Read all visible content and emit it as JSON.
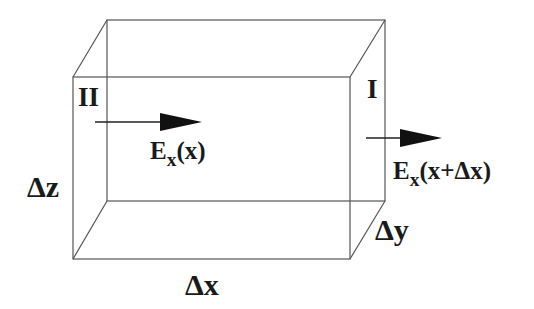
{
  "diagram": {
    "colors": {
      "line": "#555555",
      "arrow": "#111111",
      "text": "#1a1a1a",
      "background": "#ffffff"
    },
    "box": {
      "front_face": {
        "left": 73,
        "right": 350,
        "top": 77,
        "bottom": 259
      },
      "back_face": {
        "left": 107,
        "right": 385,
        "top": 20,
        "bottom": 201
      }
    },
    "faces": [
      {
        "id": "face-II",
        "label": "II"
      },
      {
        "id": "face-I",
        "label": "I"
      }
    ],
    "arrows": [
      {
        "id": "field-in",
        "symbol": "E",
        "subscript": "x",
        "argument": "(x)",
        "direction": "+x"
      },
      {
        "id": "field-out",
        "symbol": "E",
        "subscript": "x",
        "argument": "(x+Δx)",
        "direction": "+x"
      }
    ],
    "dimensions": {
      "dx": "Δx",
      "dy": "Δy",
      "dz": "Δz"
    }
  }
}
